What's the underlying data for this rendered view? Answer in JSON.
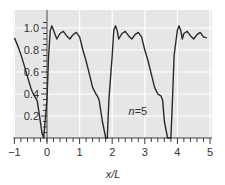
{
  "chart_data": {
    "type": "line",
    "title": "",
    "xlabel": "x/L",
    "ylabel": "",
    "xlim": [
      -1,
      5
    ],
    "ylim": [
      0,
      1.1
    ],
    "grid": true,
    "x_ticks": [
      "−1",
      "0",
      "1",
      "2",
      "3",
      "4",
      "5"
    ],
    "y_ticks": [
      "0.2",
      "0.4",
      "0.6",
      "0.8",
      "1.0"
    ],
    "annotation": {
      "text_italic": "n",
      "text_rest": "=5",
      "x": 2.5,
      "y": 0.25
    },
    "series": [
      {
        "name": "n=5",
        "x": [
          -1.0,
          -0.9,
          -0.8,
          -0.7,
          -0.6,
          -0.5,
          -0.45,
          -0.4,
          -0.3,
          -0.2,
          -0.15,
          -0.1,
          0.0,
          0.05,
          0.1,
          0.15,
          0.2,
          0.3,
          0.4,
          0.5,
          0.6,
          0.7,
          0.8,
          0.9,
          1.0,
          1.1,
          1.2,
          1.3,
          1.4,
          1.5,
          1.55,
          1.6,
          1.7,
          1.8,
          1.85,
          1.9,
          2.0,
          2.05,
          2.1,
          2.15,
          2.2,
          2.3,
          2.4,
          2.5,
          2.6,
          2.7,
          2.8,
          2.9,
          3.0,
          3.1,
          3.2,
          3.3,
          3.4,
          3.5,
          3.55,
          3.6,
          3.7,
          3.8,
          3.85,
          3.9,
          4.0,
          4.05,
          4.1,
          4.15,
          4.2,
          4.3,
          4.4,
          4.5,
          4.6,
          4.7,
          4.8,
          4.9
        ],
        "y": [
          0.91,
          0.84,
          0.76,
          0.66,
          0.56,
          0.46,
          0.42,
          0.39,
          0.34,
          0.14,
          0.04,
          0.0,
          0.35,
          0.75,
          0.98,
          1.02,
          0.98,
          0.9,
          0.95,
          0.97,
          0.93,
          0.9,
          0.94,
          0.96,
          0.92,
          0.8,
          0.7,
          0.58,
          0.46,
          0.4,
          0.38,
          0.34,
          0.15,
          0.0,
          0.0,
          0.35,
          0.75,
          0.98,
          1.02,
          0.98,
          0.9,
          0.95,
          0.97,
          0.93,
          0.9,
          0.94,
          0.96,
          0.92,
          0.8,
          0.7,
          0.58,
          0.46,
          0.4,
          0.38,
          0.34,
          0.15,
          0.0,
          0.0,
          0.35,
          0.75,
          0.98,
          1.02,
          0.98,
          0.9,
          0.95,
          0.97,
          0.93,
          0.9,
          0.94,
          0.96,
          0.92,
          0.91
        ]
      }
    ]
  },
  "colors": {
    "plot_bg": "#e6e6e6",
    "grid": "#ffffff",
    "line": "#2a2a2a",
    "axis": "#3a3a3a"
  }
}
